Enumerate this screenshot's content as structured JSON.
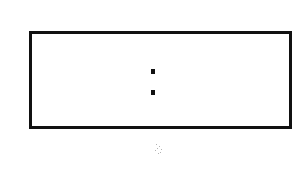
{
  "frame": {
    "border_color": "#111111",
    "background_color": "#ffffff"
  },
  "content": {
    "symbol": ":",
    "symbol_name": "colon"
  },
  "artifact": {
    "description": "faint scanner speck below frame"
  }
}
